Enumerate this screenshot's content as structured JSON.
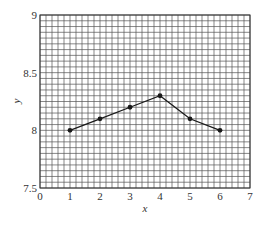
{
  "chart_data": {
    "type": "line",
    "title": "",
    "xlabel": "x",
    "ylabel": "y",
    "x": [
      1,
      2,
      3,
      4,
      5,
      6
    ],
    "series": [
      {
        "name": "y",
        "values": [
          8.0,
          8.1,
          8.2,
          8.3,
          8.1,
          8.0
        ]
      }
    ],
    "xlim": [
      0,
      7
    ],
    "ylim": [
      7.5,
      9
    ],
    "xticks": [
      0,
      1,
      2,
      3,
      4,
      5,
      6,
      7
    ],
    "yticks": [
      7.5,
      8,
      8.5,
      9
    ],
    "ytick_labels": [
      "7.5",
      "8",
      "8.5",
      "9"
    ],
    "xtick_labels": [
      "0",
      "1",
      "2",
      "3",
      "4",
      "5",
      "6",
      "7"
    ],
    "grid": true,
    "grid_minor_x_step": 0.2,
    "grid_minor_y_step": 0.05,
    "legend": null,
    "markers": "filled-circle"
  },
  "colors": {
    "line": "#1a1a1a",
    "grid": "#555555",
    "text": "#333333",
    "background": "#ffffff"
  }
}
